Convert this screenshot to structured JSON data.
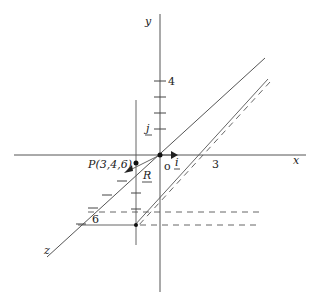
{
  "diagram": {
    "axes": {
      "x_label": "x",
      "y_label": "y",
      "z_label": "z",
      "origin_label": "o"
    },
    "unit_vectors": {
      "i": "i",
      "j": "j"
    },
    "tick_labels": {
      "x_3": "3",
      "y_4": "4",
      "z_6": "6"
    },
    "point": {
      "label": "P(3,4,6)",
      "coords": [
        3,
        4,
        6
      ]
    },
    "vector": {
      "label": "R"
    },
    "colors": {
      "stroke": "#555555",
      "text": "#222222",
      "background": "#ffffff"
    }
  }
}
